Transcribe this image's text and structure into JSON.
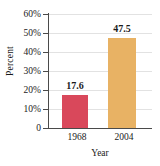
{
  "chart_data": {
    "type": "bar",
    "title": "",
    "xlabel": "Year",
    "ylabel": "Percent",
    "categories": [
      "1968",
      "2004"
    ],
    "values": [
      17.6,
      47.5
    ],
    "value_labels": [
      "17.6",
      "47.5"
    ],
    "series": [
      {
        "name": "Percent",
        "values": [
          17.6,
          47.5
        ],
        "colors": [
          "#d9485b",
          "#e8b264"
        ]
      }
    ],
    "ylim": [
      0,
      60
    ],
    "ytick_values": [
      0,
      10,
      20,
      30,
      40,
      50,
      60
    ],
    "ytick_labels": [
      "0",
      "10%",
      "20%",
      "30%",
      "40%",
      "50%",
      "60%"
    ],
    "grid": true,
    "grid_axis": "y",
    "legend": false,
    "legend_position": "none",
    "background_color": "#ffffff",
    "axis_color": "#4a4a4a",
    "grid_color": "#e2e2e2"
  }
}
